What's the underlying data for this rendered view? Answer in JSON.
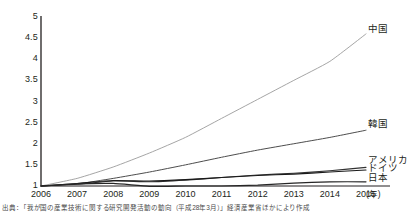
{
  "chart_data": {
    "type": "line",
    "title": "",
    "xlabel": "(年)",
    "ylabel": "",
    "x": [
      2006,
      2007,
      2008,
      2009,
      2010,
      2011,
      2012,
      2013,
      2014,
      2015
    ],
    "xlim": [
      2006,
      2015
    ],
    "ylim": [
      1,
      5
    ],
    "yticks": [
      "1",
      "1.5",
      "2",
      "2.5",
      "3",
      "3.5",
      "4",
      "4.5",
      "5"
    ],
    "ytick_values": [
      1,
      1.5,
      2,
      2.5,
      3,
      3.5,
      4,
      4.5,
      5
    ],
    "xticks": [
      "2006",
      "2007",
      "2008",
      "2009",
      "2010",
      "2011",
      "2012",
      "2013",
      "2014",
      "2015"
    ],
    "grid": false,
    "legend_position": "right-inline-labels",
    "series": [
      {
        "name": "中国",
        "color": "#9b9b9b",
        "width": 0.9,
        "values": [
          1.0,
          1.18,
          1.45,
          1.78,
          2.15,
          2.6,
          3.05,
          3.5,
          3.95,
          4.6
        ]
      },
      {
        "name": "韓国",
        "color": "#4d4d4d",
        "width": 1.0,
        "values": [
          1.0,
          1.05,
          1.18,
          1.33,
          1.5,
          1.68,
          1.85,
          2.0,
          2.15,
          2.32
        ]
      },
      {
        "name": "アメリカ",
        "color": "#333333",
        "width": 1.1,
        "values": [
          1.0,
          1.04,
          1.12,
          1.1,
          1.14,
          1.2,
          1.26,
          1.3,
          1.36,
          1.44
        ]
      },
      {
        "name": "ドイツ",
        "color": "#1a1a1a",
        "width": 1.1,
        "values": [
          1.0,
          1.06,
          1.13,
          1.12,
          1.15,
          1.2,
          1.25,
          1.28,
          1.33,
          1.38
        ]
      },
      {
        "name": "日本",
        "color": "#262626",
        "width": 1.2,
        "values": [
          1.0,
          1.05,
          1.06,
          0.99,
          1.0,
          1.0,
          1.02,
          1.07,
          1.1,
          1.1
        ]
      }
    ],
    "annotations": [
      {
        "text": "中国",
        "x": 2015,
        "y": 4.72
      },
      {
        "text": "韓国",
        "x": 2015,
        "y": 2.46
      },
      {
        "text": "アメリカ",
        "x": 2015,
        "y": 1.62
      },
      {
        "text": "ドイツ",
        "x": 2015,
        "y": 1.42
      },
      {
        "text": "日本",
        "x": 2015,
        "y": 1.18
      }
    ]
  },
  "axis": {
    "x_unit": "(年)"
  },
  "footer": {
    "source": "出典：「我が国の産業技術に関する研究開発活動の動向（平成28年3月）」経済産業省ほかにより作成"
  },
  "colors": {
    "axis": "#231f20",
    "text": "#231f20",
    "background": "#ffffff"
  }
}
